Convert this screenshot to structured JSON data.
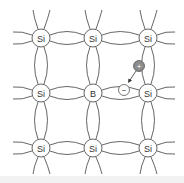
{
  "diagram": {
    "title": "",
    "atoms": [
      {
        "label": "Si",
        "row": 0,
        "col": 0
      },
      {
        "label": "Si",
        "row": 0,
        "col": 1
      },
      {
        "label": "Si",
        "row": 0,
        "col": 2
      },
      {
        "label": "Si",
        "row": 1,
        "col": 0
      },
      {
        "label": "B",
        "row": 1,
        "col": 1
      },
      {
        "label": "Si",
        "row": 1,
        "col": 2
      },
      {
        "label": "Si",
        "row": 2,
        "col": 0
      },
      {
        "label": "Si",
        "row": 2,
        "col": 1
      },
      {
        "label": "Si",
        "row": 2,
        "col": 2
      }
    ],
    "hole": {
      "label": "+",
      "color": "#8c8c8c"
    },
    "electron": {
      "label": "−"
    },
    "colors": {
      "line": "#555555",
      "atom_fill": "#ffffff",
      "hole_fill": "#8c8c8c"
    }
  }
}
